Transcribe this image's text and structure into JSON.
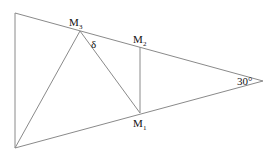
{
  "diagram": {
    "points": [
      {
        "id": "M3",
        "label": "M",
        "subscript": "3"
      },
      {
        "id": "M2",
        "label": "M",
        "subscript": "2"
      },
      {
        "id": "M1",
        "label": "M",
        "subscript": "1"
      }
    ],
    "angle_labels": [
      {
        "id": "delta",
        "text": "δ"
      },
      {
        "id": "apex",
        "text": "30°"
      }
    ]
  }
}
